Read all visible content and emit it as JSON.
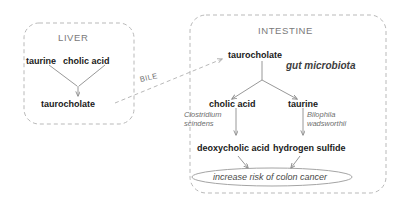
{
  "figure": {
    "type": "pathway-diagram",
    "background_color": "#ffffff"
  },
  "compartments": {
    "liver": {
      "title": "LIVER",
      "border_color": "#b9b9b9",
      "border_style": "dashed",
      "nodes": {
        "substrate_left": "taurine",
        "substrate_right": "cholic acid",
        "product": "taurocholate"
      }
    },
    "intestine": {
      "title": "INTESTINE",
      "border_color": "#b9b9b9",
      "border_style": "dashed",
      "nodes": {
        "input": "taurocholate",
        "agent": "gut microbiota",
        "product_left": "cholic acid",
        "product_right": "taurine",
        "organism_left": "Clostridium scindens",
        "organism_right": "Bilophila wadsworthii",
        "metabolite_left": "deoxycholic acid",
        "metabolite_right": "hydrogen sulfide",
        "outcome": "increase risk of colon cancer"
      }
    }
  },
  "connectors": {
    "bile_label": "BILE",
    "arrow_color": "#8c8c8c",
    "dashed_arrow_color": "#b0b0b0"
  }
}
